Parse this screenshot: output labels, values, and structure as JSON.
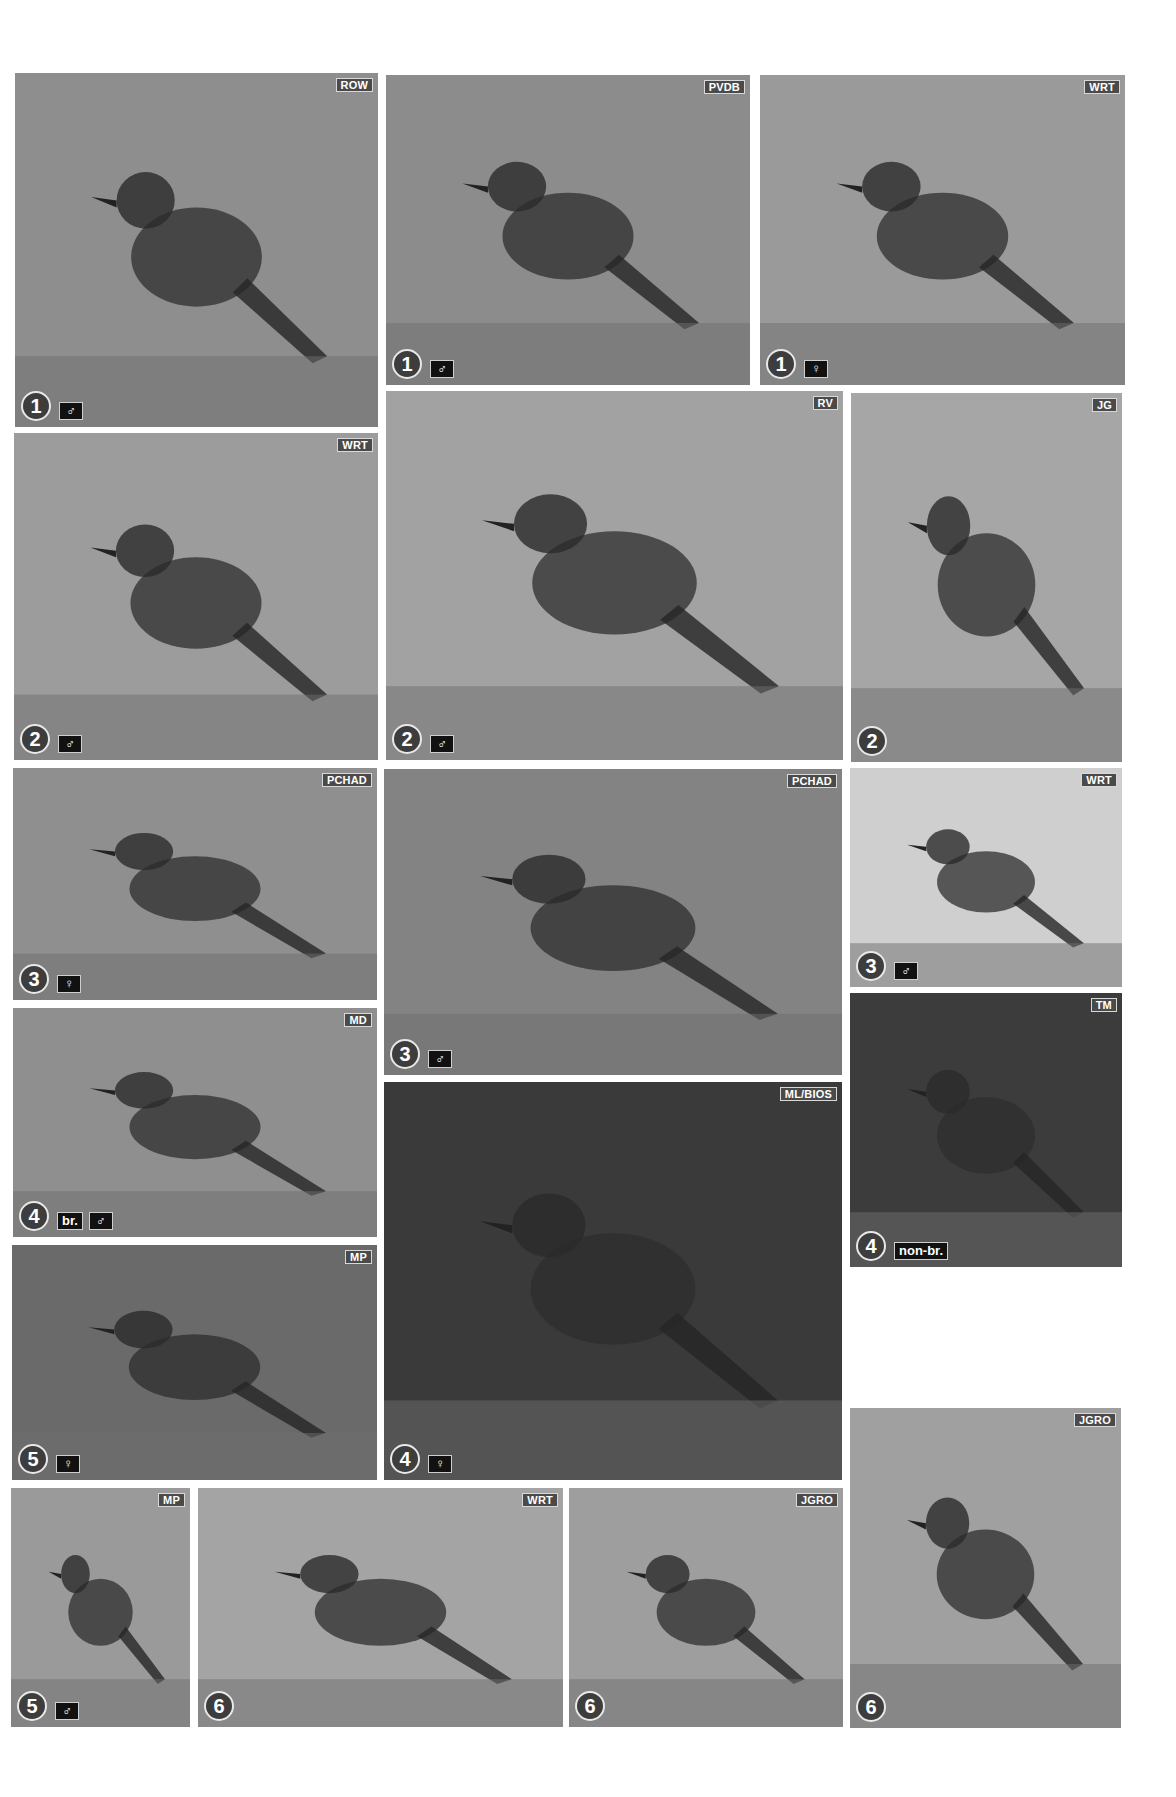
{
  "page": {
    "background": "#ffffff",
    "photo_count": 21
  },
  "plates": [
    {
      "id": "p1",
      "credit": "ROW",
      "number": "1",
      "tags": [
        "♂"
      ],
      "box": [
        15,
        73,
        363,
        354
      ],
      "tone": "#8e8e8e",
      "bird": "pied, black face, white supercilium, perched on log"
    },
    {
      "id": "p2",
      "credit": "PVDB",
      "number": "1",
      "tags": [
        "♂"
      ],
      "box": [
        386,
        75,
        364,
        310
      ],
      "tone": "#8c8c8c",
      "bird": "pied, black face, white stripe, on rock"
    },
    {
      "id": "p3",
      "credit": "WRT",
      "number": "1",
      "tags": [
        "♀"
      ],
      "box": [
        760,
        75,
        365,
        310
      ],
      "tone": "#9a9a9a",
      "bird": "streaky brown, on rock among grass"
    },
    {
      "id": "p4",
      "credit": "WRT",
      "number": "2",
      "tags": [
        "♂"
      ],
      "box": [
        14,
        433,
        364,
        327
      ],
      "tone": "#9c9c9c",
      "bird": "dark with white shoulder patch, on stick"
    },
    {
      "id": "p5",
      "credit": "RV",
      "number": "2",
      "tags": [
        "♂"
      ],
      "box": [
        386,
        391,
        457,
        369
      ],
      "tone": "#a2a2a2",
      "bird": "dark bird with spread fanned tail, on sand"
    },
    {
      "id": "p6",
      "credit": "JG",
      "number": "2",
      "tags": [],
      "box": [
        851,
        393,
        271,
        369
      ],
      "tone": "#a6a6a6",
      "bird": "all-dark bird on post"
    },
    {
      "id": "p7",
      "credit": "PCHAD",
      "number": "3",
      "tags": [
        "♀"
      ],
      "box": [
        13,
        768,
        364,
        232
      ],
      "tone": "#8f8f8f",
      "bird": "brownish bird on ledge"
    },
    {
      "id": "p8",
      "credit": "PCHAD",
      "number": "3",
      "tags": [
        "♂"
      ],
      "box": [
        384,
        769,
        458,
        306
      ],
      "tone": "#838383",
      "bird": "black bird with white wing patch"
    },
    {
      "id": "p9",
      "credit": "WRT",
      "number": "3",
      "tags": [
        "♂"
      ],
      "box": [
        850,
        768,
        272,
        219
      ],
      "tone": "#cfcfcf",
      "bird": "black and white bird on branch, cloudy sky"
    },
    {
      "id": "p10",
      "credit": "MD",
      "number": "4",
      "tags": [
        "br.",
        "♂"
      ],
      "box": [
        13,
        1008,
        364,
        229
      ],
      "tone": "#8f8f8f",
      "bird": "robin-like with black face, on branch"
    },
    {
      "id": "p11",
      "credit": "ML/BIOS",
      "number": "4",
      "tags": [
        "♀"
      ],
      "box": [
        384,
        1082,
        458,
        398
      ],
      "tone": "#3a3a3a",
      "bird": "brownish bird with insect in bill, on twig"
    },
    {
      "id": "p12",
      "credit": "TM",
      "number": "4",
      "tags": [
        "non-br."
      ],
      "box": [
        850,
        993,
        272,
        274
      ],
      "tone": "#3c3c3c",
      "bird": "pale bird among leaves"
    },
    {
      "id": "p13",
      "credit": "MP",
      "number": "5",
      "tags": [
        "♀"
      ],
      "box": [
        12,
        1245,
        365,
        235
      ],
      "tone": "#6a6a6a",
      "bird": "plain bird on reed stem"
    },
    {
      "id": "p14",
      "credit": "MP",
      "number": "5",
      "tags": [
        "♂"
      ],
      "box": [
        11,
        1488,
        179,
        239
      ],
      "tone": "#9a9a9a",
      "bird": "grey bird on ground with white supercilium"
    },
    {
      "id": "p15",
      "credit": "WRT",
      "number": "6",
      "tags": [],
      "box": [
        198,
        1488,
        365,
        239
      ],
      "tone": "#a4a4a4",
      "bird": "streaky bird on gravel"
    },
    {
      "id": "p16",
      "credit": "JGRO",
      "number": "6",
      "tags": [],
      "box": [
        569,
        1488,
        274,
        239
      ],
      "tone": "#9e9e9e",
      "bird": "streaky bird singing on twig"
    },
    {
      "id": "p17",
      "credit": "JGRO",
      "number": "6",
      "tags": [],
      "box": [
        850,
        1408,
        271,
        320
      ],
      "tone": "#a0a0a0",
      "bird": "streaky-breasted bird on thorny branch"
    }
  ]
}
